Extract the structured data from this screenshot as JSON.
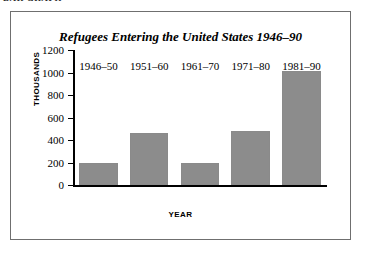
{
  "section_heading": "BAR GRAPH",
  "chart_data": {
    "type": "bar",
    "title": "Refugees Entering the United States 1946–90",
    "xlabel": "YEAR",
    "ylabel": "THOUSANDS",
    "categories": [
      "1946–50",
      "1951–60",
      "1961–70",
      "1971–80",
      "1981–90"
    ],
    "values": [
      197,
      460,
      195,
      480,
      1010
    ],
    "ylim": [
      0,
      1200
    ],
    "ytick_labels": [
      "1200",
      "1000",
      "800",
      "600",
      "400",
      "200",
      "0"
    ],
    "ytick_values": [
      1200,
      1000,
      800,
      600,
      400,
      200,
      0
    ],
    "grid": false,
    "legend": "none",
    "bar_color": "#8c8c8c",
    "axis_color": "#000000",
    "background_color": "#ffffff",
    "frame_color": "#6f6f6f"
  }
}
